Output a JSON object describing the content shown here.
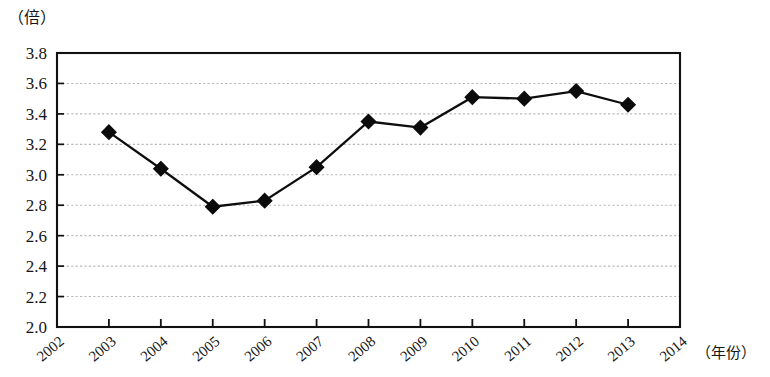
{
  "chart_data": {
    "type": "line",
    "title": "",
    "subtitle": "",
    "xlabel": "（年份）",
    "ylabel": "（倍）",
    "ylim": [
      2.0,
      3.8
    ],
    "xlim": [
      2002,
      2014
    ],
    "grid": true,
    "legend": null,
    "marker": "diamond",
    "x": [
      2003,
      2004,
      2005,
      2006,
      2007,
      2008,
      2009,
      2010,
      2011,
      2012,
      2013
    ],
    "values": [
      3.28,
      3.04,
      2.79,
      2.83,
      3.05,
      3.35,
      3.31,
      3.51,
      3.5,
      3.55,
      3.46
    ],
    "series": [
      {
        "name": "倍数",
        "values": [
          3.28,
          3.04,
          2.79,
          2.83,
          3.05,
          3.35,
          3.31,
          3.51,
          3.5,
          3.55,
          3.46
        ]
      }
    ],
    "categories": [
      "2003",
      "2004",
      "2005",
      "2006",
      "2007",
      "2008",
      "2009",
      "2010",
      "2011",
      "2012",
      "2013"
    ],
    "xticklabels": [
      "2002",
      "2003",
      "2004",
      "2005",
      "2006",
      "2007",
      "2008",
      "2009",
      "2010",
      "2011",
      "2012",
      "2013",
      "2014"
    ],
    "yticklabels": [
      "3.8",
      "3.6",
      "3.4",
      "3.2",
      "3.0",
      "2.8",
      "2.6",
      "2.4",
      "2.2",
      "2.0"
    ],
    "yticks": [
      3.8,
      3.6,
      3.4,
      3.2,
      3.0,
      2.8,
      2.6,
      2.4,
      2.2,
      2.0
    ],
    "colors": {
      "line": "#0d0d0d",
      "marker": "#0b0b0b",
      "grid": "#b9b9b9",
      "frame": "#111111",
      "background": "#ffffff"
    }
  }
}
